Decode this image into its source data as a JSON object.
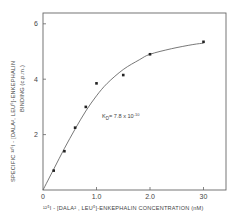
{
  "chart_data": {
    "type": "scatter",
    "title": "",
    "xlabel": "125I - [DALA2, LEU5]-ENKEPHALIN CONCENTRATION (nM)",
    "ylabel_line1": "SPECIFIC 125I - [DALA2, LEU5]-ENKEPHALIN",
    "ylabel_line2": "BINDING (c.p.m.)",
    "x_ticks": [
      {
        "value": 0,
        "label": "0"
      },
      {
        "value": 1.0,
        "label": "1.0"
      },
      {
        "value": 2.0,
        "label": "2.0"
      },
      {
        "value": 3.0,
        "label": "30"
      }
    ],
    "y_ticks": [
      {
        "value": 2,
        "label": "2"
      },
      {
        "value": 4,
        "label": "4"
      },
      {
        "value": 6,
        "label": "6"
      }
    ],
    "xlim": [
      0,
      3.4
    ],
    "ylim": [
      0,
      6.4
    ],
    "grid": false,
    "legend": null,
    "series": [
      {
        "name": "binding data",
        "x": [
          0.2,
          0.4,
          0.6,
          0.8,
          1.0,
          1.5,
          2.0,
          3.0
        ],
        "y": [
          0.7,
          1.4,
          2.25,
          3.0,
          3.85,
          4.15,
          4.9,
          5.35
        ]
      }
    ],
    "fit_curve": {
      "name": "saturation fit",
      "x": [
        0,
        0.2,
        0.4,
        0.6,
        0.8,
        1.0,
        1.2,
        1.5,
        1.8,
        2.0,
        2.4,
        2.8,
        3.0
      ],
      "y": [
        0,
        0.75,
        1.5,
        2.2,
        2.85,
        3.4,
        3.85,
        4.35,
        4.7,
        4.9,
        5.1,
        5.25,
        5.3
      ]
    },
    "annotations": [
      {
        "text": "KD= 7.8 x 10-10",
        "x": 1.05,
        "y": 2.5
      }
    ]
  },
  "labels": {
    "y_axis_line1": "SPECIFIC ¹²⁵I - [DALA², LEU⁵]-ENKEPHALIN",
    "y_axis_line2": "BINDING  (c.p.m.)",
    "x_axis": "¹²⁵I - [DALA² , LEU⁵]-ENKEPHALIN  CONCENTRATION (nM)",
    "kd_prefix": "K",
    "kd_sub": "D",
    "kd_value": "= 7.8  x  10",
    "kd_exp": "-10"
  }
}
